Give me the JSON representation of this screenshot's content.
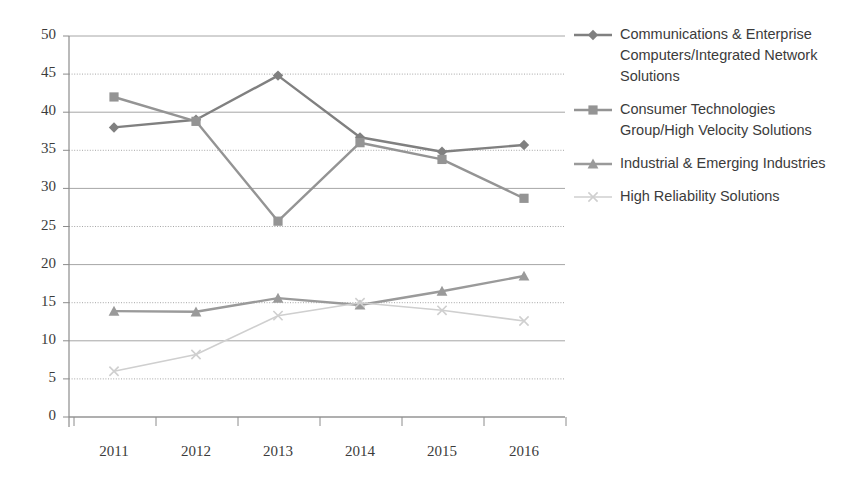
{
  "chart_data": {
    "type": "line",
    "title": "",
    "subtitle": "",
    "xlabel": "",
    "ylabel": "",
    "categories": [
      "2011",
      "2012",
      "2013",
      "2014",
      "2015",
      "2016"
    ],
    "xlim": [
      "2011",
      "2016"
    ],
    "ylim": [
      0,
      50
    ],
    "y_ticks": [
      0,
      5,
      10,
      15,
      20,
      25,
      30,
      35,
      40,
      45,
      50
    ],
    "y_tick_labels": [
      "0",
      "5",
      "10",
      "15",
      "20",
      "25",
      "30",
      "35",
      "40",
      "45",
      "50"
    ],
    "grid": "horizontal",
    "legend_position": "right",
    "series": [
      {
        "name": "Communications & Enterprise Computers/Integrated Network Solutions",
        "marker": "diamond",
        "color": "#808080",
        "values": [
          38.0,
          39.0,
          44.8,
          36.7,
          34.8,
          35.7
        ]
      },
      {
        "name": "Consumer Technologies Group/High Velocity Solutions",
        "marker": "square",
        "color": "#949494",
        "values": [
          42.0,
          38.8,
          25.7,
          36.0,
          33.8,
          28.7
        ]
      },
      {
        "name": "Industrial & Emerging Industries",
        "marker": "triangle",
        "color": "#9a9a9a",
        "values": [
          13.9,
          13.8,
          15.6,
          14.7,
          16.5,
          18.5
        ]
      },
      {
        "name": "High Reliability Solutions",
        "marker": "x",
        "color": "#cfcfcf",
        "values": [
          6.0,
          8.2,
          13.3,
          15.0,
          14.0,
          12.6
        ]
      }
    ]
  },
  "legend": {
    "entries": [
      {
        "label": "Communications & Enterprise Computers/Integrated Network Solutions",
        "marker": "diamond",
        "color": "#808080"
      },
      {
        "label": "Consumer Technologies Group/High Velocity Solutions",
        "marker": "square",
        "color": "#949494"
      },
      {
        "label": "Industrial & Emerging Industries",
        "marker": "triangle",
        "color": "#9a9a9a"
      },
      {
        "label": "High Reliability Solutions",
        "marker": "x",
        "color": "#cfcfcf"
      }
    ]
  },
  "axes": {
    "grid_color": "#a6a6a6",
    "axis_color": "#8c8c8c",
    "tick_text_color": "#3b3b3b"
  }
}
